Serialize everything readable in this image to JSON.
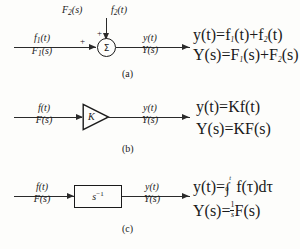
{
  "figure": {
    "background_color": "#fdfdfb",
    "line_color": "#2a2a2a"
  },
  "blocks": [
    {
      "id": "summer",
      "caption": "(a)",
      "symbol": "Σ",
      "input_left": {
        "numerator": "f",
        "num_sub": "1",
        "num_arg": "(t)",
        "denominator": "F",
        "den_sub": "1",
        "den_arg": "(s)"
      },
      "input_top": {
        "left_label_base": "F",
        "left_label_sub": "2",
        "left_label_arg": "(s)",
        "right_label_base": "f",
        "right_label_sub": "2",
        "right_label_arg": "(t)"
      },
      "signs": {
        "left": "+",
        "top": "+"
      },
      "output": {
        "numerator": "y",
        "num_arg": "(t)",
        "denominator": "Y",
        "den_arg": "(s)"
      },
      "equations": [
        "y(t) = f₁(t) + f₂(t)",
        "Y(s) = F₁(s) + F₂(s)"
      ]
    },
    {
      "id": "gain",
      "caption": "(b)",
      "symbol": "K",
      "input_left": {
        "numerator": "f",
        "num_arg": "(t)",
        "denominator": "F",
        "den_arg": "(s)"
      },
      "output": {
        "numerator": "y",
        "num_arg": "(t)",
        "denominator": "Y",
        "den_arg": "(s)"
      },
      "equations": [
        "y(t) = Kf(t)",
        "Y(s) = KF(s)"
      ]
    },
    {
      "id": "integrator",
      "caption": "(c)",
      "symbol": "s",
      "symbol_exponent": "−1",
      "input_left": {
        "numerator": "f",
        "num_arg": "(t)",
        "denominator": "F",
        "den_arg": "(s)"
      },
      "output": {
        "numerator": "y",
        "num_arg": "(t)",
        "denominator": "Y",
        "den_arg": "(s)"
      },
      "equations": [
        "y(t) = ∫₀ᵗ f(τ)dτ",
        "Y(s) = (1/s)F(s)"
      ]
    }
  ],
  "eq_a": {
    "line1": {
      "lhs_base": "y",
      "lhs_arg": "(t)",
      "eq": "=",
      "t1_base": "f",
      "t1_sub": "1",
      "t1_arg": "(t)",
      "op": "+",
      "t2_base": "f",
      "t2_sub": "2",
      "t2_arg": "(t)"
    },
    "line2": {
      "lhs_base": "Y",
      "lhs_arg": "(s)",
      "eq": "=",
      "t1_base": "F",
      "t1_sub": "1",
      "t1_arg": "(s)",
      "op": "+",
      "t2_base": "F",
      "t2_sub": "2",
      "t2_arg": "(s)"
    }
  },
  "eq_b": {
    "line1": {
      "lhs_base": "y",
      "lhs_arg": "(t)",
      "eq": "=",
      "rhs": "Kf(t)"
    },
    "line2": {
      "lhs_base": "Y",
      "lhs_arg": "(s)",
      "eq": "=",
      "rhs": "KF(s)"
    }
  },
  "eq_c": {
    "line1": {
      "lhs_base": "y",
      "lhs_arg": "(t)",
      "eq": "=",
      "limit_upper": "t",
      "limit_lower": "0",
      "integrand": "f(τ)",
      "differential": "dτ"
    },
    "line2": {
      "lhs_base": "Y",
      "lhs_arg": "(s)",
      "eq": "=",
      "frac_num": "1",
      "frac_den": "s",
      "rhs": "F(s)"
    }
  },
  "captions": {
    "a": "(a)",
    "b": "(b)",
    "c": "(c)"
  }
}
